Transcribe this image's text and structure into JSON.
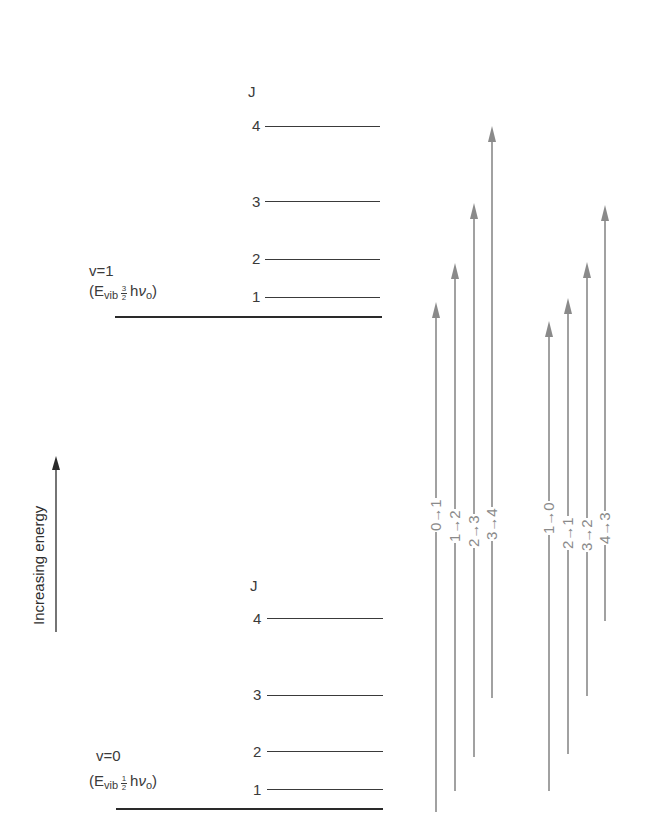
{
  "diagram": {
    "axis_label": "Increasing energy",
    "colors": {
      "levels": "#3a3a3a",
      "arrows": "#8a8a8a",
      "text": "#3a3a3a"
    },
    "upper_state": {
      "v_label": "v=1",
      "energy_open": "(E",
      "energy_sub": "vib",
      "frac_num": "3",
      "frac_den": "2",
      "energy_h": "h",
      "energy_nu": "ν",
      "energy_nu_sub": "o",
      "energy_close": ")",
      "j_header": "J",
      "levels": [
        {
          "j": "4",
          "y": 126
        },
        {
          "j": "3",
          "y": 202
        },
        {
          "j": "2",
          "y": 259
        },
        {
          "j": "1",
          "y": 297
        }
      ],
      "base_y": 317
    },
    "lower_state": {
      "v_label": "v=0",
      "energy_open": "(E",
      "energy_sub": "vib",
      "frac_num": "1",
      "frac_den": "2",
      "energy_h": "h",
      "energy_nu": "ν",
      "energy_nu_sub": "o",
      "energy_close": ")",
      "j_header": "J",
      "levels": [
        {
          "j": "4",
          "y": 619
        },
        {
          "j": "3",
          "y": 695
        },
        {
          "j": "2",
          "y": 752
        },
        {
          "j": "1",
          "y": 790
        }
      ],
      "base_y": 809
    },
    "transitions": {
      "r_branch": [
        {
          "label": "0→1",
          "x": 436,
          "y_from": 812,
          "y_to": 302
        },
        {
          "label": "1→2",
          "x": 455,
          "y_from": 791,
          "y_to": 263
        },
        {
          "label": "2→3",
          "x": 474,
          "y_from": 757,
          "y_to": 203
        },
        {
          "label": "3→4",
          "x": 492,
          "y_from": 698,
          "y_to": 126
        }
      ],
      "p_branch": [
        {
          "label": "1→0",
          "x": 549,
          "y_from": 791,
          "y_to": 321
        },
        {
          "label": "2→1",
          "x": 568,
          "y_from": 754,
          "y_to": 298
        },
        {
          "label": "3→2",
          "x": 587,
          "y_from": 696,
          "y_to": 262
        },
        {
          "label": "4→3",
          "x": 605,
          "y_from": 621,
          "y_to": 205
        }
      ]
    }
  }
}
